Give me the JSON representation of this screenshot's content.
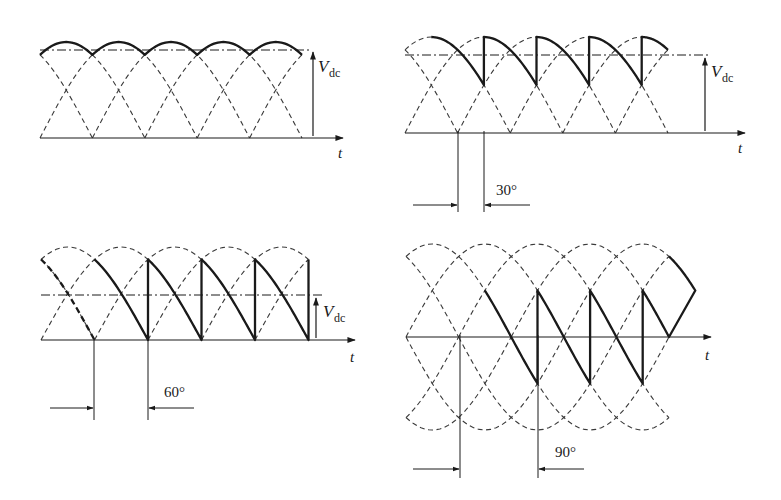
{
  "figure": {
    "ink_color": "#1a1a1a",
    "dash_color": "#3a3a3a",
    "panels": [
      {
        "id": "alpha-0",
        "alpha_deg": 0,
        "x0": 40,
        "axis_y": 138,
        "period_px": 52.4,
        "amplitude_px": 96,
        "pulses": 5,
        "axis_end_x": 343,
        "vdc_line_y": 50,
        "vdc_line_end_x": 312,
        "vdc_arrow_x": 313,
        "vdc_arrow_top_y": 52,
        "vdc_label": {
          "main": "V",
          "sub": "dc",
          "x": 318,
          "y": 72
        },
        "t_label": {
          "text": "t",
          "x": 338,
          "y": 158
        },
        "angle_label": null,
        "markers": null
      },
      {
        "id": "alpha-30",
        "alpha_deg": 30,
        "x0": 405,
        "axis_y": 133,
        "period_px": 52.6,
        "amplitude_px": 96,
        "pulses": 5,
        "axis_end_x": 745,
        "vdc_line_y": 55,
        "vdc_line_end_x": 708,
        "vdc_arrow_x": 705,
        "vdc_arrow_top_y": 58,
        "vdc_label": {
          "main": "V",
          "sub": "dc",
          "x": 711,
          "y": 77
        },
        "t_label": {
          "text": "t",
          "x": 738,
          "y": 153
        },
        "angle_label": {
          "text": "30°",
          "x": 496,
          "y": 195
        },
        "markers": {
          "x1": 458,
          "x2": 484,
          "bottom_y": 212,
          "arrow_y": 205,
          "left_tail_x": 413,
          "right_tail_x": 530
        }
      },
      {
        "id": "alpha-60",
        "alpha_deg": 60,
        "x0": 41,
        "axis_y": 340,
        "period_px": 53.5,
        "amplitude_px": 93,
        "pulses": 5,
        "axis_end_x": 355,
        "vdc_line_y": 295,
        "vdc_line_end_x": 322,
        "vdc_arrow_x": 316,
        "vdc_arrow_top_y": 298,
        "vdc_label": {
          "main": "V",
          "sub": "dc",
          "x": 323,
          "y": 317
        },
        "t_label": {
          "text": "t",
          "x": 350,
          "y": 362
        },
        "angle_label": {
          "text": "60°",
          "x": 164,
          "y": 397
        },
        "markers": {
          "x1": 94,
          "x2": 148,
          "bottom_y": 420,
          "arrow_y": 408,
          "left_tail_x": 50,
          "right_tail_x": 194
        },
        "extra_dashed_bold": true
      },
      {
        "id": "alpha-90",
        "alpha_deg": 90,
        "x0": 406,
        "axis_y": 337,
        "period_px": 52.6,
        "amplitude_px": 93,
        "pulses": 5,
        "axis_end_x": 711,
        "vdc_line_y": null,
        "t_label": {
          "text": "t",
          "x": 705,
          "y": 360
        },
        "angle_label": {
          "text": "90°",
          "x": 555,
          "y": 457
        },
        "markers": {
          "x1": 460,
          "x2": 538,
          "bottom_y": 478,
          "arrow_y": 469,
          "left_tail_x": 413,
          "right_tail_x": 584
        },
        "mirror_arcs": true
      }
    ]
  }
}
